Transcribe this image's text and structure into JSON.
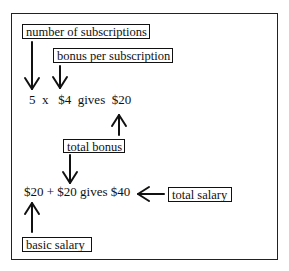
{
  "diagram": {
    "labels": {
      "number_of_subscriptions": "number of subscriptions",
      "bonus_per_subscription": "bonus per subscription",
      "total_bonus": "total bonus",
      "total_salary": "total salary",
      "basic_salary": "basic salary"
    },
    "equations": {
      "bonus_calc": "5  x   $4  gives  $20",
      "salary_calc": "$20 + $20 gives $40"
    },
    "arrows": [
      {
        "from": "number of subscriptions",
        "to": "5",
        "direction": "down"
      },
      {
        "from": "bonus per subscription",
        "to": "$4",
        "direction": "down"
      },
      {
        "from": "total bonus",
        "to": "$20 (bonus result)",
        "direction": "up"
      },
      {
        "from": "total bonus",
        "to": "$20 (second term)",
        "direction": "down"
      },
      {
        "from": "total salary",
        "to": "$40",
        "direction": "left"
      },
      {
        "from": "basic salary",
        "to": "$20 (first term)",
        "direction": "up"
      }
    ],
    "colors": {
      "ink": "#111111",
      "background": "#ffffff"
    }
  }
}
